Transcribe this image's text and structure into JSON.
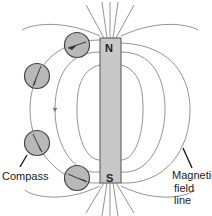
{
  "diagram": {
    "magnet": {
      "north_label": "N",
      "south_label": "S"
    },
    "labels": {
      "compass": "Compass",
      "field_line_1": "Magnetic",
      "field_line_2": "field line"
    },
    "colors": {
      "magnet": "#c8c8c8",
      "line": "#7a7a7a",
      "compass_fill": "#b8b8b8"
    }
  }
}
